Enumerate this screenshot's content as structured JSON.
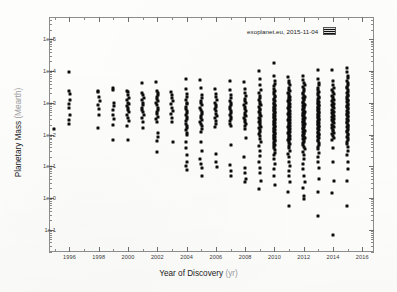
{
  "figure": {
    "background_color": "#fdfdfc",
    "frame_color": "#8d8d8d",
    "marker_color": "#0d0d0d"
  },
  "legend": {
    "label": "exoplanet.eu, 2015-11-04",
    "swatch_name": "legend-marker-swatch",
    "position": "top-right-inside"
  },
  "axes": {
    "x": {
      "title_main": "Year of Discovery",
      "title_unit": "(yr)",
      "tick_labels": [
        "1996",
        "1998",
        "2000",
        "2002",
        "2004",
        "2006",
        "2008",
        "2010",
        "2012",
        "2014",
        "2016"
      ],
      "tick_values": [
        1996,
        1998,
        2000,
        2002,
        2004,
        2006,
        2008,
        2010,
        2012,
        2014,
        2016
      ],
      "range": [
        1994.6,
        2016.8
      ],
      "scale": "linear"
    },
    "y": {
      "title_main": "Planetary Mass",
      "title_unit": "(Mearth)",
      "tick_labels": [
        "1e+5",
        "1e+4",
        "1e+3",
        "1e+2",
        "1e+1",
        "1e+0",
        "1e-1"
      ],
      "tick_values": [
        100000,
        10000,
        1000,
        100,
        10,
        1,
        0.1
      ],
      "range": [
        0.02,
        500000
      ],
      "scale": "log"
    }
  },
  "chart_data": {
    "type": "scatter",
    "title": "",
    "xlabel": "Year of Discovery (yr)",
    "ylabel": "Planetary Mass (Mearth)",
    "xlim": [
      1994.6,
      2016.8
    ],
    "ylim": [
      0.02,
      500000
    ],
    "yscale": "log",
    "xscale": "linear",
    "grid": false,
    "legend_position": "upper right",
    "legend_entries": [
      "exoplanet.eu, 2015-11-04"
    ],
    "marker": "square",
    "marker_color": "#0d0d0d",
    "series": [
      {
        "name": "exoplanet.eu, 2015-11-04",
        "note": "Each x column is one discovery year; y values are planetary masses in Earth masses (log scale).",
        "columns": [
          {
            "year": 1995,
            "count": 1,
            "mass_min": 150,
            "mass_max": 150,
            "masses": [
              150
            ]
          },
          {
            "year": 1996,
            "count": 9,
            "mass_min": 200,
            "mass_max": 9000,
            "masses": [
              9000,
              2400,
              1900,
              1200,
              900,
              700,
              400,
              280,
              210
            ]
          },
          {
            "year": 1998,
            "count": 8,
            "mass_min": 160,
            "mass_max": 2300,
            "masses": [
              2300,
              2100,
              1500,
              1100,
              850,
              640,
              420,
              165
            ]
          },
          {
            "year": 1999,
            "count": 9,
            "mass_min": 65,
            "mass_max": 3000,
            "masses": [
              3000,
              2600,
              1000,
              800,
              600,
              420,
              300,
              200,
              68
            ]
          },
          {
            "year": 2000,
            "count": 16,
            "mass_min": 65,
            "mass_max": 2400,
            "masses": [
              2400,
              2100,
              1800,
              1400,
              1200,
              1000,
              900,
              800,
              700,
              600,
              500,
              420,
              330,
              260,
              190,
              66
            ]
          },
          {
            "year": 2001,
            "count": 14,
            "mass_min": 150,
            "mass_max": 4200,
            "masses": [
              4200,
              2000,
              1700,
              1400,
              1200,
              1000,
              850,
              700,
              600,
              500,
              400,
              320,
              240,
              160
            ]
          },
          {
            "year": 2002,
            "count": 20,
            "mass_min": 27,
            "mass_max": 4600,
            "masses": [
              4600,
              2400,
              2000,
              1700,
              1500,
              1300,
              1100,
              950,
              820,
              700,
              600,
              510,
              430,
              360,
              300,
              250,
              110,
              85,
              62,
              28
            ]
          },
          {
            "year": 2003,
            "count": 11,
            "mass_min": 55,
            "mass_max": 2200,
            "masses": [
              2200,
              1800,
              1400,
              1100,
              900,
              700,
              560,
              450,
              340,
              240,
              57
            ]
          },
          {
            "year": 2004,
            "count": 27,
            "mass_min": 7,
            "mass_max": 5500,
            "masses": [
              5500,
              2800,
              1900,
              1500,
              1200,
              1000,
              880,
              760,
              650,
              560,
              480,
              410,
              350,
              300,
              260,
              220,
              190,
              160,
              135,
              115,
              95,
              60,
              38,
              22,
              14,
              10,
              7.5
            ]
          },
          {
            "year": 2005,
            "count": 25,
            "mass_min": 4.5,
            "mass_max": 5200,
            "masses": [
              5200,
              3000,
              1800,
              1400,
              1150,
              950,
              820,
              700,
              600,
              520,
              450,
              390,
              340,
              290,
              250,
              210,
              180,
              150,
              120,
              60,
              30,
              17,
              12,
              9,
              4.8
            ]
          },
          {
            "year": 2006,
            "count": 18,
            "mass_min": 9,
            "mass_max": 2700,
            "masses": [
              2700,
              1900,
              1500,
              1200,
              1000,
              850,
              720,
              620,
              530,
              450,
              380,
              320,
              270,
              220,
              170,
              25,
              14,
              9.5
            ]
          },
          {
            "year": 2007,
            "count": 21,
            "mass_min": 4.5,
            "mass_max": 4800,
            "masses": [
              4800,
              2600,
              1800,
              1400,
              1150,
              980,
              840,
              720,
              620,
              540,
              470,
              400,
              350,
              300,
              260,
              220,
              190,
              48,
              11,
              7,
              4.8
            ]
          },
          {
            "year": 2008,
            "count": 26,
            "mass_min": 3,
            "mass_max": 4500,
            "masses": [
              4500,
              2800,
              2000,
              1600,
              1300,
              1100,
              950,
              820,
              720,
              630,
              550,
              480,
              420,
              370,
              320,
              280,
              245,
              210,
              180,
              150,
              75,
              19,
              9,
              6,
              4,
              3.2
            ]
          },
          {
            "year": 2009,
            "count": 40,
            "mass_min": 1.8,
            "mass_max": 9800,
            "masses": [
              9800,
              5600,
              3600,
              2600,
              2000,
              1650,
              1400,
              1200,
              1050,
              920,
              820,
              730,
              650,
              580,
              520,
              470,
              420,
              380,
              340,
              305,
              275,
              248,
              222,
              198,
              176,
              156,
              138,
              120,
              104,
              88,
              72,
              56,
              42,
              30,
              21,
              14,
              9,
              6,
              3.5,
              1.9
            ]
          },
          {
            "year": 2010,
            "count": 66,
            "mass_min": 2.5,
            "mass_max": 18000,
            "masses": [
              18000,
              7000,
              5000,
              4000,
              3300,
              2800,
              2400,
              2100,
              1850,
              1650,
              1480,
              1340,
              1220,
              1110,
              1010,
              930,
              860,
              795,
              735,
              680,
              630,
              585,
              545,
              508,
              473,
              440,
              410,
              382,
              356,
              332,
              310,
              289,
              270,
              252,
              235,
              219,
              204,
              190,
              177,
              165,
              154,
              143,
              133,
              124,
              115,
              107,
              99,
              92,
              85,
              79,
              73,
              67,
              62,
              57,
              52,
              47,
              42,
              37,
              32,
              27,
              22,
              17,
              12,
              8,
              5,
              2.6
            ]
          },
          {
            "year": 2011,
            "count": 72,
            "mass_min": 0.55,
            "mass_max": 6600,
            "masses": [
              6600,
              5000,
              4100,
              3500,
              3000,
              2600,
              2300,
              2050,
              1850,
              1680,
              1530,
              1400,
              1290,
              1190,
              1100,
              1020,
              950,
              885,
              825,
              770,
              720,
              675,
              632,
              592,
              555,
              520,
              488,
              458,
              430,
              404,
              380,
              357,
              335,
              315,
              296,
              278,
              261,
              245,
              230,
              216,
              203,
              190,
              178,
              167,
              156,
              146,
              137,
              128,
              120,
              112,
              105,
              98,
              91,
              85,
              79,
              73,
              67,
              61,
              55,
              49,
              43,
              37,
              31,
              25,
              19,
              14,
              10,
              7,
              5,
              3.2,
              1.6,
              0.58
            ]
          },
          {
            "year": 2012,
            "count": 70,
            "mass_min": 0.85,
            "mass_max": 6800,
            "masses": [
              6800,
              5200,
              4300,
              3600,
              3100,
              2700,
              2350,
              2080,
              1860,
              1680,
              1530,
              1400,
              1285,
              1180,
              1090,
              1005,
              930,
              862,
              800,
              744,
              692,
              645,
              601,
              561,
              524,
              490,
              458,
              429,
              401,
              376,
              352,
              330,
              309,
              290,
              272,
              255,
              239,
              224,
              210,
              197,
              184,
              172,
              161,
              150,
              140,
              131,
              122,
              114,
              106,
              98,
              91,
              84,
              78,
              71,
              65,
              59,
              53,
              47,
              41,
              35,
              29,
              23,
              17,
              12,
              8,
              5,
              3.2,
              2.0,
              1.2,
              0.9
            ]
          },
          {
            "year": 2013,
            "count": 62,
            "mass_min": 0.26,
            "mass_max": 11000,
            "masses": [
              11000,
              5500,
              4200,
              3500,
              2950,
              2550,
              2220,
              1960,
              1740,
              1560,
              1410,
              1280,
              1170,
              1070,
              985,
              908,
              838,
              775,
              718,
              666,
              618,
              574,
              533,
              496,
              461,
              429,
              399,
              371,
              345,
              321,
              299,
              278,
              259,
              241,
              224,
              208,
              194,
              180,
              167,
              155,
              144,
              134,
              124,
              115,
              106,
              98,
              90,
              83,
              76,
              69,
              62,
              55,
              48,
              41,
              34,
              27,
              20,
              14,
              9,
              4,
              1.5,
              0.28
            ]
          },
          {
            "year": 2014,
            "count": 48,
            "mass_min": 0.065,
            "mass_max": 10500,
            "masses": [
              10500,
              4800,
              3600,
              2900,
              2450,
              2120,
              1860,
              1650,
              1480,
              1335,
              1210,
              1100,
              1005,
              920,
              845,
              778,
              717,
              662,
              612,
              566,
              524,
              486,
              450,
              417,
              386,
              358,
              331,
              306,
              283,
              261,
              241,
              222,
              204,
              187,
              171,
              156,
              142,
              128,
              115,
              102,
              90,
              78,
              66,
              38,
              14,
              3.5,
              1.4,
              0.068
            ]
          },
          {
            "year": 2015,
            "count": 58,
            "mass_min": 0.55,
            "mass_max": 12500,
            "masses": [
              12500,
              9500,
              7200,
              5800,
              4900,
              4200,
              3650,
              3200,
              2820,
              2500,
              2230,
              2000,
              1800,
              1625,
              1475,
              1340,
              1220,
              1115,
              1020,
              935,
              858,
              789,
              726,
              668,
              615,
              566,
              521,
              480,
              442,
              407,
              374,
              344,
              316,
              290,
              266,
              244,
              224,
              205,
              188,
              172,
              157,
              143,
              130,
              118,
              107,
              96,
              86,
              76,
              67,
              58,
              49,
              40,
              31,
              22,
              14,
              8,
              3.5,
              0.58
            ]
          }
        ]
      }
    ]
  }
}
